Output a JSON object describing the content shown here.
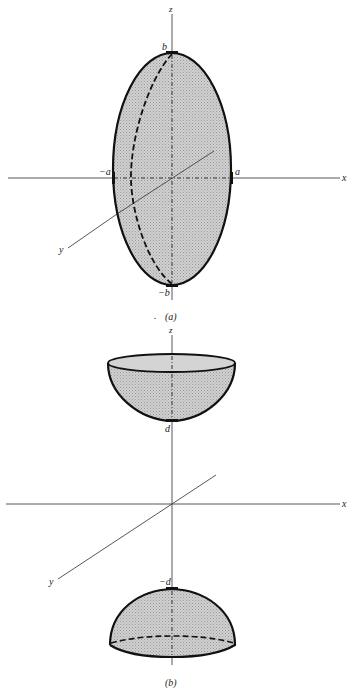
{
  "figure": {
    "panel_a": {
      "caption": "(a)",
      "description": "Prolate spheroid (ellipsoid of revolution) centered at origin",
      "axis_labels": {
        "z": "z",
        "x": "x",
        "y": "y"
      },
      "tick_labels": {
        "top": "b",
        "bottom": "−b",
        "left": "−a",
        "right": "a"
      },
      "colors": {
        "fill": "#c8c8c8",
        "outline": "#111111",
        "axis": "#444444"
      }
    },
    "panel_b": {
      "caption": "(b)",
      "description": "Two half-spheroid caps separated along z axis at distance d above and below the origin",
      "axis_labels": {
        "z": "z",
        "x": "x",
        "y": "y"
      },
      "tick_labels": {
        "upper": "d",
        "lower": "−d"
      },
      "colors": {
        "fill": "#c8c8c8",
        "outline": "#111111",
        "axis": "#444444"
      }
    },
    "stray_mark": "."
  }
}
